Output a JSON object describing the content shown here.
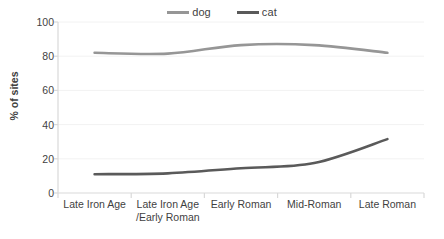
{
  "legend": {
    "position": "top",
    "entries": [
      {
        "label": "dog",
        "color": "#969696"
      },
      {
        "label": "cat",
        "color": "#5a5a5a"
      }
    ]
  },
  "axes": {
    "ylabel": "% of sites",
    "yticks": [
      "100",
      "80",
      "60",
      "40",
      "20",
      "0"
    ],
    "xticks": [
      "Late Iron Age",
      "Late Iron Age\n/Early Roman",
      "Early Roman",
      "Mid-Roman",
      "Late Roman"
    ]
  },
  "colors": {
    "dog": "#969696",
    "cat": "#5a5a5a",
    "axis": "#d9d9d9",
    "grid": "#f2f2f2",
    "text": "#3f3f3f"
  },
  "chart_data": {
    "type": "line",
    "title": "",
    "xlabel": "",
    "ylabel": "% of sites",
    "ylim": [
      0,
      100
    ],
    "ytick_values": [
      0,
      20,
      40,
      60,
      80,
      100
    ],
    "grid": false,
    "legend_position": "top",
    "categories": [
      "Late Iron Age",
      "Late Iron Age /Early Roman",
      "Early Roman",
      "Mid-Roman",
      "Late Roman"
    ],
    "series": [
      {
        "name": "dog",
        "color": "#969696",
        "values": [
          82,
          81.5,
          86.5,
          86.5,
          82
        ]
      },
      {
        "name": "cat",
        "color": "#5a5a5a",
        "values": [
          11,
          11.5,
          14.5,
          17.5,
          31.5
        ]
      }
    ]
  }
}
